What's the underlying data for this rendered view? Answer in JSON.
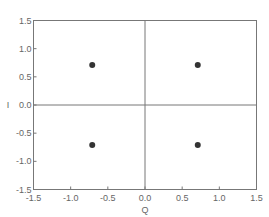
{
  "chart_data": {
    "type": "scatter",
    "title": "",
    "xlabel": "Q",
    "ylabel": "I",
    "xlim": [
      -1.5,
      1.5
    ],
    "ylim": [
      -1.5,
      1.5
    ],
    "xticks": [
      -1.5,
      -1.0,
      -0.5,
      0.0,
      0.5,
      1.0,
      1.5
    ],
    "yticks": [
      -1.5,
      -1.0,
      -0.5,
      0.0,
      0.5,
      1.0,
      1.5
    ],
    "xtick_labels": [
      "-1.5",
      "-1.0",
      "-0.5",
      "0.0",
      "0.5",
      "1.0",
      "1.5"
    ],
    "ytick_labels": [
      "-1.5",
      "-1.0",
      "-0.5",
      "0.0",
      "0.5",
      "1.0",
      "1.5"
    ],
    "grid": false,
    "zero_lines": true,
    "legend": null,
    "series": [
      {
        "name": "constellation",
        "points": [
          {
            "x": -0.71,
            "y": 0.71
          },
          {
            "x": 0.71,
            "y": 0.71
          },
          {
            "x": -0.71,
            "y": -0.71
          },
          {
            "x": 0.71,
            "y": -0.71
          }
        ],
        "color": "#333333"
      }
    ]
  },
  "colors": {
    "frame": "#777777",
    "marker": "#333333",
    "text": "#666666"
  }
}
